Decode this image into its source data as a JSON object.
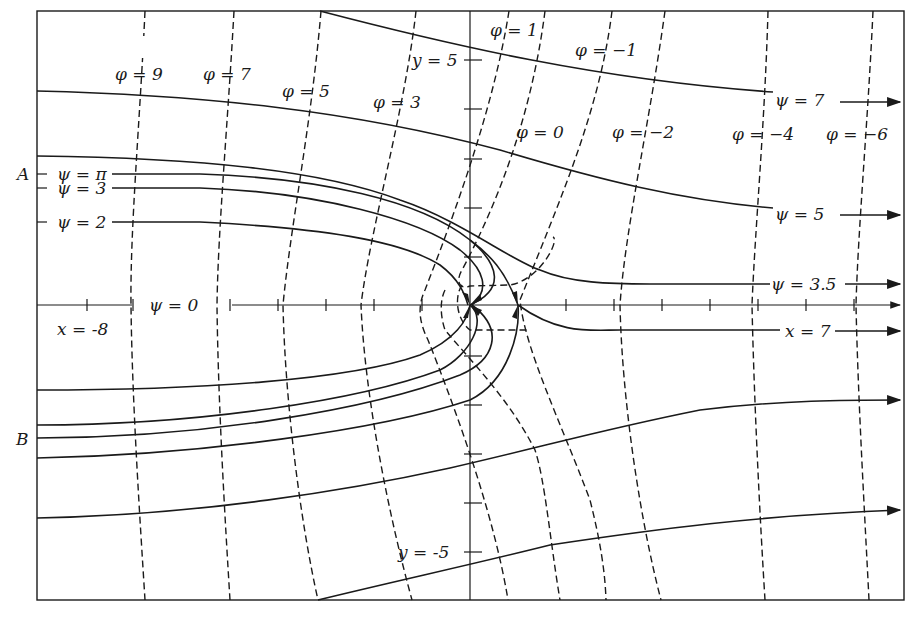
{
  "figure": {
    "axes": {
      "x_label": "x = -8",
      "x_label_right": "x = 7",
      "y_label_top": "y = 5",
      "y_label_bottom": "y = -5",
      "x_ticks": [
        -8,
        -7,
        -6,
        -5,
        -4,
        -3,
        -2,
        -1,
        0,
        1,
        2,
        3,
        4,
        5,
        6,
        7,
        8
      ],
      "y_ticks": [
        -5,
        -4,
        -3,
        -2,
        -1,
        0,
        1,
        2,
        3,
        4,
        5
      ]
    },
    "point_labels": {
      "A": "A",
      "B": "B"
    },
    "equipotentials": [
      {
        "label": "φ = 9"
      },
      {
        "label": "φ = 7"
      },
      {
        "label": "φ = 5"
      },
      {
        "label": "φ = 3"
      },
      {
        "label": "φ = 1"
      },
      {
        "label": "φ = 0"
      },
      {
        "label": "φ = −1"
      },
      {
        "label": "φ = −2"
      },
      {
        "label": "φ = −4"
      },
      {
        "label": "φ = −6"
      }
    ],
    "streamlines": [
      {
        "label": "ψ = 7"
      },
      {
        "label": "ψ = 5"
      },
      {
        "label": "ψ = 3.5"
      },
      {
        "label": "ψ = π"
      },
      {
        "label": "ψ = 3"
      },
      {
        "label": "ψ = 2"
      },
      {
        "label": "ψ = 0"
      }
    ]
  }
}
